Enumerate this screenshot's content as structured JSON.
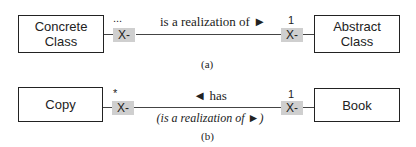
{
  "diagram_a": {
    "left_class": {
      "line1": "Concrete",
      "line2": "Class"
    },
    "right_class": {
      "line1": "Abstract",
      "line2": "Class"
    },
    "left_tag": "X-",
    "right_tag": "X-",
    "left_multiplicity": "...",
    "right_multiplicity": "1",
    "association_label": "is a realization of ►",
    "caption": "(a)"
  },
  "diagram_b": {
    "left_class": "Copy",
    "right_class": "Book",
    "left_tag": "X-",
    "right_tag": "X-",
    "left_multiplicity": "*",
    "right_multiplicity": "1",
    "association_label": "◄ has",
    "sub_label": "(is a realization of ►)",
    "caption": "(b)"
  },
  "colors": {
    "tag_fill": "#cfcfcf",
    "stroke": "#222222"
  }
}
